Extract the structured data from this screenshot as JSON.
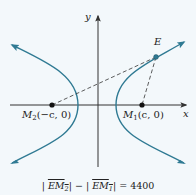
{
  "diagram": {
    "type": "hyperbola",
    "colors": {
      "background": "#f3f8fb",
      "curve": "#2f7a93",
      "axis": "#333333",
      "point": "#111111",
      "point_E": "#2f7a93",
      "dashed": "#333333"
    },
    "axes": {
      "x_label": "x",
      "y_label": "y"
    },
    "points": {
      "E": {
        "label": "E"
      },
      "M1": {
        "name": "M",
        "subscript": "1",
        "coords": "(c, 0)"
      },
      "M2": {
        "name": "M",
        "subscript": "2",
        "coords": "(−c, 0)"
      }
    },
    "equation": {
      "left_open": "|",
      "term1_name": "EM",
      "term1_sub": "2",
      "left_close": "|",
      "minus": " − ",
      "right_open": "|",
      "term2_name": "EM",
      "term2_sub": "1",
      "right_close": "|",
      "equals": " = ",
      "value": "4400"
    }
  }
}
